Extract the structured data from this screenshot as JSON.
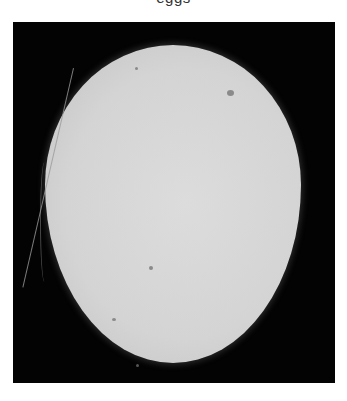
{
  "caption": {
    "text": "eggs",
    "partially_visible": true
  },
  "image": {
    "subject": "candled-egg",
    "background_color": "#030303",
    "egg_color": "#d6d6d6",
    "features": [
      "hairline-crack",
      "dark-spots"
    ]
  }
}
